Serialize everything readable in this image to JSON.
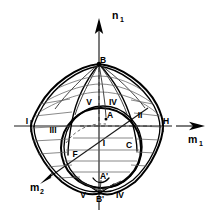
{
  "figure": {
    "type": "technical-line-diagram",
    "background_color": "#ffffff",
    "line_color": "#000000",
    "mesh_color": "#5a5a5a"
  },
  "axes": [
    {
      "id": "n1",
      "label": "n",
      "subscript": "1",
      "direction": "up",
      "arrow": true,
      "label_x": 112,
      "label_y": 16,
      "sub_x": 120,
      "sub_y": 20
    },
    {
      "id": "m1",
      "label": "m",
      "subscript": "1",
      "direction": "right",
      "arrow": true,
      "label_x": 190,
      "label_y": 140,
      "sub_x": 200,
      "sub_y": 144
    },
    {
      "id": "m2",
      "label": "m",
      "subscript": "2",
      "direction": "lower-left",
      "arrow": true,
      "label_x": 30,
      "label_y": 188,
      "sub_x": 39,
      "sub_y": 192
    }
  ],
  "points": [
    {
      "id": "B",
      "label": "B",
      "x": 103,
      "y": 61,
      "prime": false
    },
    {
      "id": "A",
      "label": "A",
      "x": 110,
      "y": 116,
      "prime": false
    },
    {
      "id": "C",
      "label": "C",
      "x": 129,
      "y": 146,
      "prime": false
    },
    {
      "id": "F",
      "label": "F",
      "x": 75,
      "y": 155,
      "prime": false
    },
    {
      "id": "H",
      "label": "H",
      "x": 166,
      "y": 123,
      "prime": false
    },
    {
      "id": "I_left",
      "label": "I",
      "x": 29,
      "y": 123,
      "prime": false
    },
    {
      "id": "A_prime",
      "label": "A'",
      "x": 104,
      "y": 177,
      "prime": true
    },
    {
      "id": "B_prime",
      "label": "B'",
      "x": 100,
      "y": 199,
      "prime": true
    }
  ],
  "regions": [
    {
      "id": "I",
      "label": "I",
      "x": 104,
      "y": 143
    },
    {
      "id": "II",
      "label": "II",
      "x": 139,
      "y": 116
    },
    {
      "id": "III",
      "label": "III",
      "x": 53,
      "y": 131
    },
    {
      "id": "IV",
      "label": "IV",
      "x": 113,
      "y": 103
    },
    {
      "id": "V",
      "label": "V",
      "x": 89,
      "y": 103
    }
  ],
  "bottom_region_labels": [
    {
      "id": "V_bottom",
      "label": "V",
      "x": 83,
      "y": 195
    },
    {
      "id": "IV_bottom",
      "label": "IV",
      "x": 119,
      "y": 195
    }
  ],
  "geometry": {
    "apex_top": {
      "x": 99,
      "y": 64
    },
    "apex_bottom": {
      "x": 100,
      "y": 193
    },
    "center": {
      "x": 99,
      "y": 126
    },
    "equator_y": 126,
    "left_extreme_x": 31,
    "right_extreme_x": 163,
    "inner_circle": {
      "cx": 101,
      "cy": 148,
      "rx": 40,
      "ry": 40
    }
  }
}
